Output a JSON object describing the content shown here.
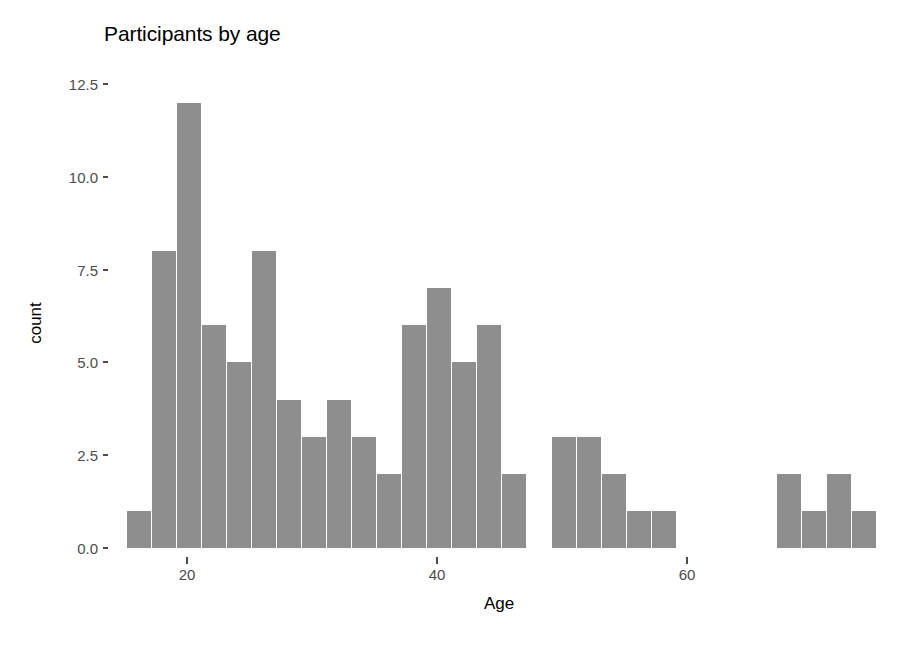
{
  "chart_data": {
    "type": "bar",
    "title": "Participants by age",
    "xlabel": "Age",
    "ylabel": "count",
    "xlim": [
      14,
      76
    ],
    "ylim": [
      0,
      13.2
    ],
    "grid": false,
    "legend": null,
    "bar_color": "#8e8e8e",
    "bin_width": 2,
    "x_ticks": [
      {
        "value": 20,
        "label": "20"
      },
      {
        "value": 40,
        "label": "40"
      },
      {
        "value": 60,
        "label": "60"
      }
    ],
    "y_ticks": [
      {
        "value": 0.0,
        "label": "0.0"
      },
      {
        "value": 2.5,
        "label": "2.5"
      },
      {
        "value": 5.0,
        "label": "5.0"
      },
      {
        "value": 7.5,
        "label": "7.5"
      },
      {
        "value": 10.0,
        "label": "10.0"
      },
      {
        "value": 12.5,
        "label": "12.5"
      }
    ],
    "bins": [
      {
        "x_start": 15.2,
        "x_end": 17.2,
        "center": 16.2,
        "count": 1
      },
      {
        "x_start": 17.2,
        "x_end": 19.2,
        "center": 18.2,
        "count": 8
      },
      {
        "x_start": 19.2,
        "x_end": 21.2,
        "center": 20.2,
        "count": 12
      },
      {
        "x_start": 21.2,
        "x_end": 23.2,
        "center": 22.2,
        "count": 6
      },
      {
        "x_start": 23.2,
        "x_end": 25.2,
        "center": 24.2,
        "count": 5
      },
      {
        "x_start": 25.2,
        "x_end": 27.2,
        "center": 26.2,
        "count": 8
      },
      {
        "x_start": 27.2,
        "x_end": 29.2,
        "center": 28.2,
        "count": 4
      },
      {
        "x_start": 29.2,
        "x_end": 31.2,
        "center": 30.2,
        "count": 3
      },
      {
        "x_start": 31.2,
        "x_end": 33.2,
        "center": 32.2,
        "count": 4
      },
      {
        "x_start": 33.2,
        "x_end": 35.2,
        "center": 34.2,
        "count": 3
      },
      {
        "x_start": 35.2,
        "x_end": 37.2,
        "center": 36.2,
        "count": 2
      },
      {
        "x_start": 37.2,
        "x_end": 39.2,
        "center": 38.2,
        "count": 6
      },
      {
        "x_start": 39.2,
        "x_end": 41.2,
        "center": 40.2,
        "count": 7
      },
      {
        "x_start": 41.2,
        "x_end": 43.2,
        "center": 42.2,
        "count": 5
      },
      {
        "x_start": 43.2,
        "x_end": 45.2,
        "center": 44.2,
        "count": 6
      },
      {
        "x_start": 45.2,
        "x_end": 47.2,
        "center": 46.2,
        "count": 2
      },
      {
        "x_start": 47.2,
        "x_end": 49.2,
        "center": 48.2,
        "count": 0
      },
      {
        "x_start": 49.2,
        "x_end": 51.2,
        "center": 50.2,
        "count": 3
      },
      {
        "x_start": 51.2,
        "x_end": 53.2,
        "center": 52.2,
        "count": 3
      },
      {
        "x_start": 53.2,
        "x_end": 55.2,
        "center": 54.2,
        "count": 2
      },
      {
        "x_start": 55.2,
        "x_end": 57.2,
        "center": 56.2,
        "count": 1
      },
      {
        "x_start": 57.2,
        "x_end": 59.2,
        "center": 58.2,
        "count": 1
      },
      {
        "x_start": 59.2,
        "x_end": 61.2,
        "center": 60.2,
        "count": 0
      },
      {
        "x_start": 61.2,
        "x_end": 63.2,
        "center": 62.2,
        "count": 0
      },
      {
        "x_start": 63.2,
        "x_end": 65.2,
        "center": 64.2,
        "count": 0
      },
      {
        "x_start": 65.2,
        "x_end": 67.2,
        "center": 66.2,
        "count": 0
      },
      {
        "x_start": 67.2,
        "x_end": 69.2,
        "center": 68.2,
        "count": 2
      },
      {
        "x_start": 69.2,
        "x_end": 71.2,
        "center": 70.2,
        "count": 1
      },
      {
        "x_start": 71.2,
        "x_end": 73.2,
        "center": 72.2,
        "count": 2
      },
      {
        "x_start": 73.2,
        "x_end": 75.2,
        "center": 74.2,
        "count": 1
      }
    ]
  }
}
